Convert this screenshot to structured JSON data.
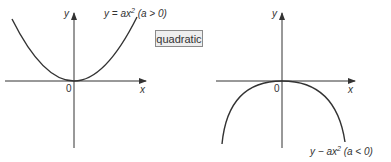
{
  "button": {
    "label": "quadratic"
  },
  "graphs": [
    {
      "id": "positive",
      "label_y": "y",
      "label_x": "x",
      "label_origin": "0",
      "equation": {
        "lhs": "y = ax",
        "exp": "2",
        "cond": " (a > 0)"
      },
      "opens": "up"
    },
    {
      "id": "negative",
      "label_y": "y",
      "label_x": "x",
      "label_origin": "0",
      "equation": {
        "lhs": "y − ax",
        "exp": "2",
        "cond": " (a < 0)"
      },
      "opens": "down"
    }
  ],
  "colors": {
    "ink": "#333333",
    "button_bg": "#eeeeee",
    "button_border": "#8a8a8a"
  }
}
